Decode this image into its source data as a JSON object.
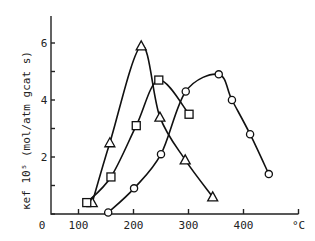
{
  "chart_data": {
    "type": "line",
    "title": "",
    "xlabel": "°C",
    "ylabel": "κef 10⁵ (mol/atm gcat s)",
    "xlim": [
      50,
      500
    ],
    "ylim": [
      0,
      7
    ],
    "grid": false,
    "x_ticks": [
      100,
      200,
      300,
      400,
      500
    ],
    "x_tick_labels": [
      "0",
      "100",
      "200",
      "300",
      "400",
      "°C"
    ],
    "y_ticks": [
      0,
      1,
      2,
      3,
      4,
      5,
      6
    ],
    "y_tick_labels": [
      "2",
      "4",
      "6"
    ],
    "series": [
      {
        "name": "triangles",
        "marker": "triangle",
        "x": [
          125,
          157,
          214,
          248,
          294,
          344
        ],
        "y": [
          0.4,
          2.5,
          5.9,
          3.4,
          1.9,
          0.6
        ]
      },
      {
        "name": "squares",
        "marker": "square",
        "x": [
          115,
          159,
          205,
          246,
          301
        ],
        "y": [
          0.4,
          1.3,
          3.1,
          4.7,
          3.5
        ]
      },
      {
        "name": "circles",
        "marker": "circle",
        "x": [
          154,
          201,
          250,
          295,
          355,
          379,
          412,
          446
        ],
        "y": [
          0.05,
          0.9,
          2.1,
          4.3,
          4.9,
          4.0,
          2.8,
          1.4
        ]
      }
    ]
  }
}
